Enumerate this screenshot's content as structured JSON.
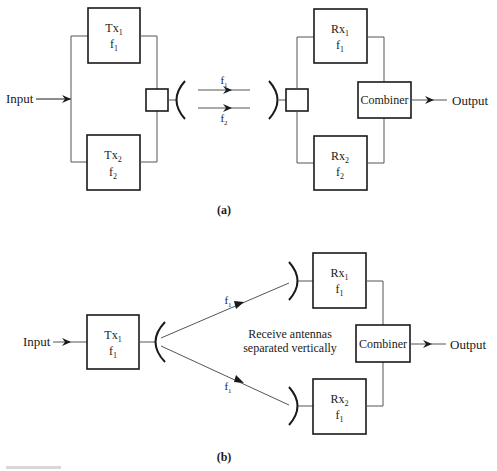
{
  "diagram_a": {
    "caption": "(a)",
    "input_label": "Input",
    "output_label": "Output",
    "tx": [
      {
        "name": "Tx",
        "sub": "1",
        "freq": "f",
        "freq_sub": "1"
      },
      {
        "name": "Tx",
        "sub": "2",
        "freq": "f",
        "freq_sub": "2"
      }
    ],
    "rx": [
      {
        "name": "Rx",
        "sub": "1",
        "freq": "f",
        "freq_sub": "1"
      },
      {
        "name": "Rx",
        "sub": "2",
        "freq": "f",
        "freq_sub": "2"
      }
    ],
    "links": [
      {
        "freq": "f",
        "freq_sub": "1"
      },
      {
        "freq": "f",
        "freq_sub": "2"
      }
    ],
    "combiner_label": "Combiner"
  },
  "diagram_b": {
    "caption": "(b)",
    "input_label": "Input",
    "output_label": "Output",
    "tx": {
      "name": "Tx",
      "sub": "1",
      "freq": "f",
      "freq_sub": "1"
    },
    "rx": [
      {
        "name": "Rx",
        "sub": "1",
        "freq": "f",
        "freq_sub": "1"
      },
      {
        "name": "Rx",
        "sub": "2",
        "freq": "f",
        "freq_sub": "1"
      }
    ],
    "links": [
      {
        "freq": "f",
        "freq_sub": "1"
      },
      {
        "freq": "f",
        "freq_sub": "1"
      }
    ],
    "annotation_line1": "Receive antennas",
    "annotation_line2": "separated vertically",
    "combiner_label": "Combiner"
  },
  "colors": {
    "ink": "#1a1a1a",
    "wire": "#555555",
    "background": "#ffffff"
  }
}
